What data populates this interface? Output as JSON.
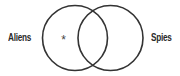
{
  "diagram": {
    "type": "venn",
    "sets": [
      {
        "label": "Aliens",
        "side": "left"
      },
      {
        "label": "Spies",
        "side": "right"
      }
    ],
    "marker": {
      "symbol": "*",
      "region": "Aliens only"
    },
    "colors": {
      "stroke": "#333333",
      "text": "#2a2a2a",
      "background": "#ffffff"
    }
  }
}
